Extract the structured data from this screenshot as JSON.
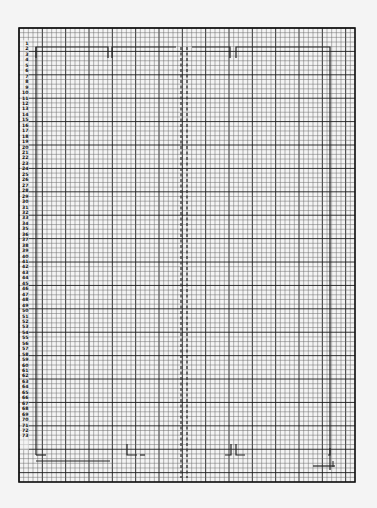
{
  "chart": {
    "type": "knitting-grid",
    "background": "#f4f4f4",
    "grid_line_color": "#6a6a6a",
    "grid_bold_color": "#1a1a1a",
    "outline_color": "#222222",
    "frame": {
      "x": 19,
      "y": 28,
      "width": 336,
      "height": 454
    },
    "cols": 72,
    "rows": 97,
    "bold_every": 5,
    "row_labels_start": 1,
    "row_labels_end": 73,
    "row_label_first_y": 43,
    "row_label_spacing": 5.45
  },
  "row_labels": [
    "1",
    "2",
    "3",
    "4",
    "5",
    "6",
    "7",
    "8",
    "9",
    "10",
    "11",
    "12",
    "13",
    "14",
    "15",
    "16",
    "17",
    "18",
    "19",
    "20",
    "21",
    "22",
    "23",
    "24",
    "25",
    "26",
    "27",
    "28",
    "29",
    "30",
    "31",
    "32",
    "33",
    "34",
    "35",
    "36",
    "37",
    "38",
    "39",
    "40",
    "41",
    "42",
    "43",
    "44",
    "45",
    "46",
    "47",
    "48",
    "49",
    "50",
    "51",
    "52",
    "53",
    "54",
    "55",
    "56",
    "57",
    "58",
    "59",
    "60",
    "61",
    "62",
    "63",
    "64",
    "65",
    "66",
    "67",
    "68",
    "69",
    "70",
    "71",
    "72",
    "73"
  ]
}
